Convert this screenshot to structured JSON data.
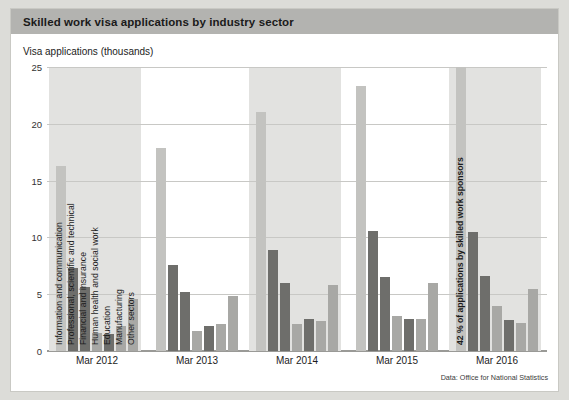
{
  "header": {
    "title": "Skilled work visa applications by industry sector"
  },
  "axis": {
    "ylabel": "Visa applications (thousands)",
    "yticks": [
      "0",
      "5",
      "10",
      "15",
      "20",
      "25"
    ],
    "ytick_values": [
      0,
      5,
      10,
      15,
      20,
      25
    ],
    "ymin": 0,
    "ymax": 25
  },
  "annotation": {
    "text": "42 % of applications by skilled work sponsors"
  },
  "source": {
    "text": "Data: Office for National Statistics"
  },
  "colors": {
    "title_bar": "#b3b3b0",
    "card": "#ffffff",
    "page": "#dcdcd8",
    "band": "#e2e2e0",
    "grid": "#c8c8c5",
    "bar_light": "#c3c3c0",
    "bar_mid": "#a8a8a5",
    "bar_dark": "#6e6e6b"
  },
  "chart_data": {
    "type": "bar",
    "title": "Skilled work visa applications by industry sector",
    "xlabel": "",
    "ylabel": "Visa applications (thousands)",
    "ylim": [
      0,
      25
    ],
    "grid": true,
    "legend": "inline-rotated-labels",
    "categories": [
      "Mar 2012",
      "Mar 2013",
      "Mar 2014",
      "Mar 2015",
      "Mar 2016"
    ],
    "series": [
      {
        "name": "Information and communication",
        "color": "#c3c3c0",
        "values": [
          16.3,
          17.9,
          21.0,
          23.3,
          25.0
        ]
      },
      {
        "name": "Professional, scientific and technical",
        "color": "#6e6e6b",
        "values": [
          7.3,
          7.6,
          8.9,
          10.6,
          10.5
        ]
      },
      {
        "name": "Financial and insurance",
        "color": "#6e6e6b",
        "values": [
          5.6,
          5.2,
          6.0,
          6.5,
          6.6
        ]
      },
      {
        "name": "Human health and social work",
        "color": "#a8a8a5",
        "values": [
          1.6,
          1.8,
          2.4,
          3.1,
          4.0
        ]
      },
      {
        "name": "Education",
        "color": "#6e6e6b",
        "values": [
          1.5,
          2.2,
          2.8,
          2.8,
          2.7
        ]
      },
      {
        "name": "Manufacturing",
        "color": "#a8a8a5",
        "values": [
          2.2,
          2.4,
          2.6,
          2.8,
          2.5
        ]
      },
      {
        "name": "Other sectors",
        "color": "#a8a8a5",
        "values": [
          4.6,
          4.8,
          5.8,
          6.0,
          5.5
        ]
      }
    ]
  }
}
